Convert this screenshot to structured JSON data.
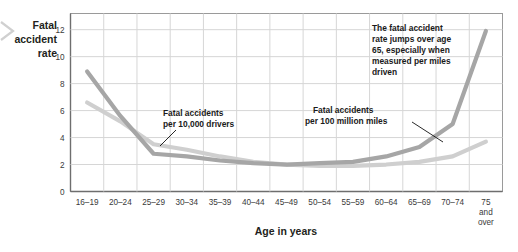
{
  "chart_data": {
    "type": "line",
    "title": "",
    "xlabel": "Age in years",
    "ylabel": "Fatal accident rate",
    "categories": [
      "16–19",
      "20–24",
      "25–29",
      "30–34",
      "35–39",
      "40–44",
      "45–49",
      "50–54",
      "55–59",
      "60–64",
      "65–69",
      "70–74",
      "75 and over"
    ],
    "ytick_labels": [
      "0",
      "2",
      "4",
      "6",
      "8",
      "10",
      "12"
    ],
    "ytick_values": [
      0,
      2,
      4,
      6,
      8,
      10,
      12
    ],
    "ylim": [
      0,
      13.2
    ],
    "grid": true,
    "legend": "annotations",
    "series": [
      {
        "name": "Fatal accidents per 100 million miles",
        "color": "#a6a6a6",
        "values": [
          8.9,
          5.6,
          2.8,
          2.6,
          2.3,
          2.1,
          2.0,
          2.1,
          2.2,
          2.6,
          3.3,
          5.0,
          11.9
        ]
      },
      {
        "name": "Fatal accidents per 10,000 drivers",
        "color": "#cfcfcf",
        "values": [
          6.6,
          5.2,
          3.5,
          3.1,
          2.6,
          2.2,
          2.0,
          1.9,
          1.9,
          2.0,
          2.2,
          2.6,
          3.7
        ]
      }
    ],
    "annotations": [
      {
        "id": "annot-drivers",
        "line1": "Fatal accidents",
        "line2": "per 10,000 drivers",
        "points_to_category": "30–34"
      },
      {
        "id": "annot-miles",
        "line1": "Fatal accidents",
        "line2": "per 100 million miles",
        "points_to_category": "70–74"
      },
      {
        "id": "annot-callout",
        "line1": "The fatal accident",
        "line2": "rate jumps over age",
        "line3": "65, especially when",
        "line4": "measured per miles",
        "line5": "driven"
      }
    ]
  },
  "axis": {
    "y_title_line1": "Fatal",
    "y_title_line2": "accident",
    "y_title_line3": "rate",
    "x_title": "Age in years",
    "last_category_line1": "75",
    "last_category_line2": "and",
    "last_category_line3": "over"
  }
}
